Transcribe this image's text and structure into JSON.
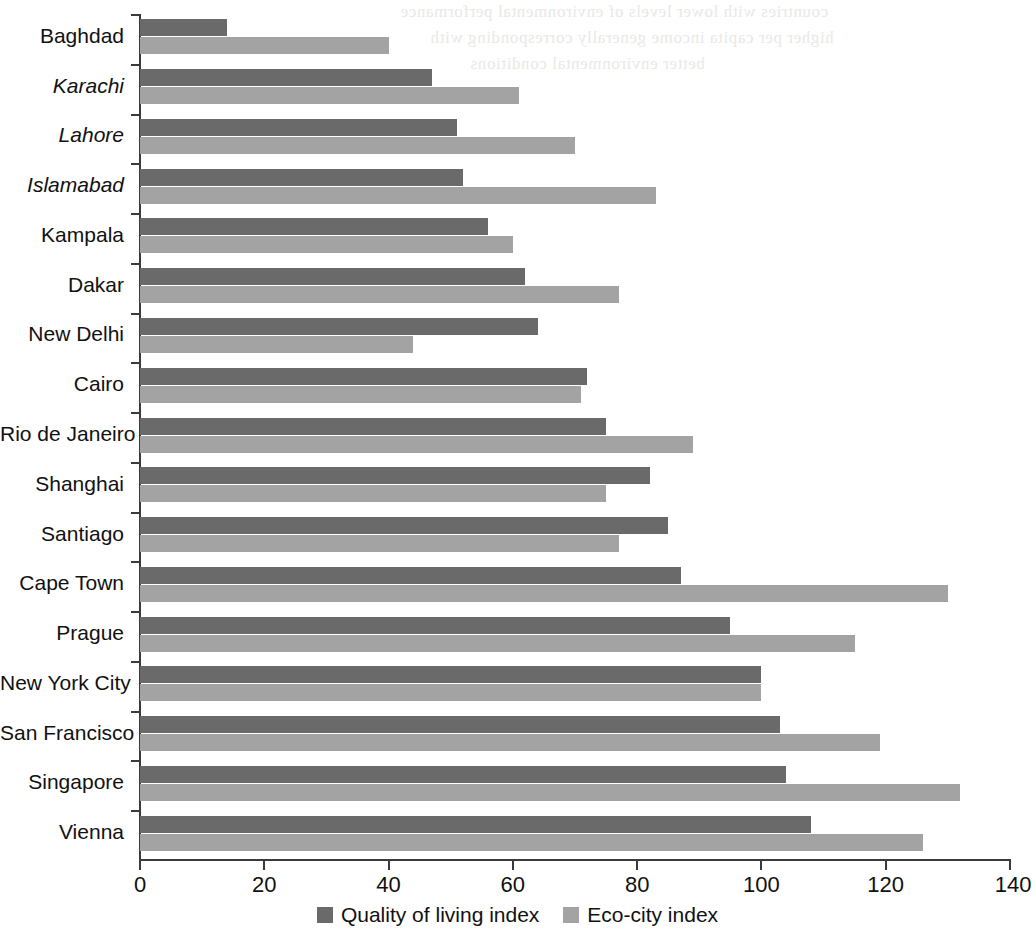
{
  "chart_data": {
    "type": "bar",
    "orientation": "horizontal",
    "title": "",
    "subtitle": "",
    "xlabel": "",
    "ylabel": "",
    "xlim": [
      0,
      140
    ],
    "xticks": [
      0,
      20,
      40,
      60,
      80,
      100,
      120,
      140
    ],
    "xtick_labels": [
      "0",
      "20",
      "40",
      "60",
      "80",
      "100",
      "120",
      "140"
    ],
    "grid": false,
    "legend_position": "bottom-center",
    "categories": [
      "Baghdad",
      "Karachi",
      "Lahore",
      "Islamabad",
      "Kampala",
      "Dakar",
      "New Delhi",
      "Cairo",
      "Rio de Janeiro",
      "Shanghai",
      "Santiago",
      "Cape Town",
      "Prague",
      "New York City",
      "San Francisco",
      "Singapore",
      "Vienna"
    ],
    "category_styles": [
      "normal",
      "italic",
      "italic",
      "italic",
      "normal",
      "normal",
      "normal",
      "normal",
      "normal",
      "normal",
      "normal",
      "normal",
      "normal",
      "normal",
      "normal",
      "normal",
      "normal"
    ],
    "series": [
      {
        "name": "Quality of living index",
        "color": "#6a6a6a",
        "values": [
          14,
          47,
          51,
          52,
          56,
          62,
          64,
          72,
          75,
          82,
          85,
          87,
          95,
          100,
          103,
          104,
          108
        ]
      },
      {
        "name": "Eco-city index",
        "color": "#a3a3a3",
        "values": [
          40,
          61,
          70,
          83,
          60,
          77,
          44,
          71,
          89,
          75,
          77,
          130,
          115,
          100,
          119,
          132,
          126
        ]
      }
    ]
  },
  "legend": {
    "items": [
      {
        "label": "Quality of living index",
        "color": "#6a6a6a",
        "swatch_name": "legend-swatch-quality-of-living"
      },
      {
        "label": "Eco-city index",
        "color": "#a3a3a3",
        "swatch_name": "legend-swatch-eco-city"
      }
    ]
  },
  "ghost_text": {
    "lines": [
      "countries with lower levels of environmental performance",
      "higher per capita income generally corresponding with",
      "better environmental conditions"
    ]
  }
}
